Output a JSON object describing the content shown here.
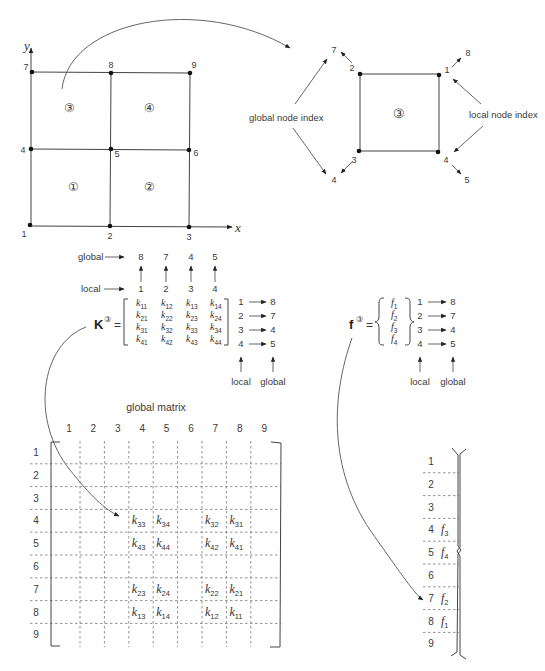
{
  "mesh": {
    "axis_x": "x",
    "axis_y": "y",
    "nodes": [
      {
        "id": "1",
        "x": 30,
        "y": 225
      },
      {
        "id": "2",
        "x": 110,
        "y": 226
      },
      {
        "id": "3",
        "x": 189,
        "y": 227
      },
      {
        "id": "4",
        "x": 31,
        "y": 149
      },
      {
        "id": "5",
        "x": 111,
        "y": 149
      },
      {
        "id": "6",
        "x": 189,
        "y": 150
      },
      {
        "id": "7",
        "x": 32,
        "y": 72
      },
      {
        "id": "8",
        "x": 111,
        "y": 73
      },
      {
        "id": "9",
        "x": 190,
        "y": 73
      }
    ],
    "elements": [
      {
        "label": "①",
        "x": 73,
        "y": 191
      },
      {
        "label": "②",
        "x": 149,
        "y": 191
      },
      {
        "label": "③",
        "x": 69,
        "y": 112
      },
      {
        "label": "④",
        "x": 149,
        "y": 112
      }
    ]
  },
  "element_detail": {
    "element_label": "③",
    "global_node_index_label": "global node index",
    "local_node_index_label": "local node index",
    "corners": [
      {
        "local": "1",
        "global": "8"
      },
      {
        "local": "2",
        "global": "7"
      },
      {
        "local": "3",
        "global": "4"
      },
      {
        "local": "4",
        "global": "5"
      }
    ]
  },
  "stiffness": {
    "symbol": "K",
    "superscript": "③",
    "equals": "=",
    "global_label": "global",
    "local_label": "local",
    "column_global": [
      "8",
      "7",
      "4",
      "5"
    ],
    "column_local": [
      "1",
      "2",
      "3",
      "4"
    ],
    "entries": [
      [
        "11",
        "12",
        "13",
        "14"
      ],
      [
        "21",
        "22",
        "23",
        "24"
      ],
      [
        "31",
        "32",
        "33",
        "34"
      ],
      [
        "41",
        "42",
        "43",
        "44"
      ]
    ],
    "row_map": [
      {
        "local": "1",
        "global": "8"
      },
      {
        "local": "2",
        "global": "7"
      },
      {
        "local": "3",
        "global": "4"
      },
      {
        "local": "4",
        "global": "5"
      }
    ],
    "bottom_local_label": "local",
    "bottom_global_label": "global"
  },
  "force": {
    "symbol": "f",
    "superscript": "③",
    "equals": "=",
    "entries": [
      "1",
      "2",
      "3",
      "4"
    ],
    "row_map": [
      {
        "local": "1",
        "global": "8"
      },
      {
        "local": "2",
        "global": "7"
      },
      {
        "local": "3",
        "global": "4"
      },
      {
        "local": "4",
        "global": "5"
      }
    ],
    "bottom_local_label": "local",
    "bottom_global_label": "global"
  },
  "global_matrix": {
    "title": "global matrix",
    "col_headers": [
      "1",
      "2",
      "3",
      "4",
      "5",
      "6",
      "7",
      "8",
      "9"
    ],
    "row_headers": [
      "1",
      "2",
      "3",
      "4",
      "5",
      "6",
      "7",
      "8",
      "9"
    ],
    "cells": [
      {
        "row": 4,
        "col": 4,
        "sub": "33"
      },
      {
        "row": 4,
        "col": 5,
        "sub": "34"
      },
      {
        "row": 4,
        "col": 7,
        "sub": "32"
      },
      {
        "row": 4,
        "col": 8,
        "sub": "31"
      },
      {
        "row": 5,
        "col": 4,
        "sub": "43"
      },
      {
        "row": 5,
        "col": 5,
        "sub": "44"
      },
      {
        "row": 5,
        "col": 7,
        "sub": "42"
      },
      {
        "row": 5,
        "col": 8,
        "sub": "41"
      },
      {
        "row": 7,
        "col": 4,
        "sub": "23"
      },
      {
        "row": 7,
        "col": 5,
        "sub": "24"
      },
      {
        "row": 7,
        "col": 7,
        "sub": "22"
      },
      {
        "row": 7,
        "col": 8,
        "sub": "21"
      },
      {
        "row": 8,
        "col": 4,
        "sub": "13"
      },
      {
        "row": 8,
        "col": 5,
        "sub": "14"
      },
      {
        "row": 8,
        "col": 7,
        "sub": "12"
      },
      {
        "row": 8,
        "col": 8,
        "sub": "11"
      }
    ]
  },
  "global_vector": {
    "row_headers": [
      "1",
      "2",
      "3",
      "4",
      "5",
      "6",
      "7",
      "8",
      "9"
    ],
    "cells": [
      {
        "row": 4,
        "sub": "3"
      },
      {
        "row": 5,
        "sub": "4"
      },
      {
        "row": 7,
        "sub": "2"
      },
      {
        "row": 8,
        "sub": "1"
      }
    ]
  }
}
